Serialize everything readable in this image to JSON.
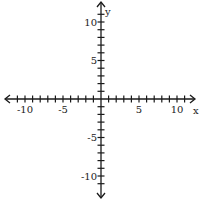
{
  "chart_data": {
    "type": "scatter",
    "title": "",
    "xlabel": "x",
    "ylabel": "y",
    "xlim": [
      -12,
      12
    ],
    "ylim": [
      -12,
      12
    ],
    "grid": false,
    "xticks": [
      -10,
      -5,
      5,
      10
    ],
    "yticks": [
      10,
      5,
      -5,
      -10
    ],
    "xtick_labels": [
      "-10",
      "-5",
      "5",
      "10"
    ],
    "ytick_labels": [
      "10",
      "5",
      "-5",
      "-10"
    ],
    "minor_tick_step": 1,
    "series": []
  },
  "colors": {
    "axis": "#1a1a1a",
    "background": "#ffffff"
  }
}
